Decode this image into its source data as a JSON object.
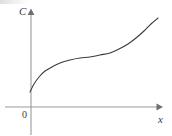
{
  "figure": {
    "kind": "cartesian-sketch",
    "width": 172,
    "height": 135,
    "background_color": "#ffffff",
    "axis_color": "#9b9b9b",
    "curve_color": "#3a3a3a",
    "label_color": "#3c3c3c",
    "y_axis_label": "C",
    "x_axis_label": "x",
    "origin_label": "0"
  },
  "chart_data": {
    "type": "line",
    "title": "",
    "subtitle": "",
    "xlabel": "x",
    "ylabel": "C",
    "grid": false,
    "legend": null,
    "legend_position": "none",
    "annotations": [],
    "axes": {
      "x_axis_pixel_y": 107,
      "y_axis_pixel_x": 31,
      "x_axis_from_pixel_x": 5,
      "x_axis_to_pixel_x": 160,
      "y_axis_from_pixel_y": 12,
      "y_axis_to_pixel_y": 135,
      "x_arrow": true,
      "y_arrow": true,
      "x_tick_labels": [],
      "y_tick_labels": [],
      "xlim": [
        0,
        1
      ],
      "ylim": [
        0,
        1
      ]
    },
    "series": [
      {
        "name": "C(x)",
        "shape": "monotonic-increasing-sigmoid",
        "color": "#3a3a3a",
        "line_width": 1.1,
        "points_pixel": [
          [
            30,
            92
          ],
          [
            34,
            84
          ],
          [
            39,
            77
          ],
          [
            45,
            71
          ],
          [
            52,
            67
          ],
          [
            60,
            63
          ],
          [
            70,
            60
          ],
          [
            80,
            58
          ],
          [
            90,
            57
          ],
          [
            100,
            55
          ],
          [
            110,
            53
          ],
          [
            119,
            49
          ],
          [
            128,
            44
          ],
          [
            136,
            38
          ],
          [
            144,
            31
          ],
          [
            151,
            24
          ],
          [
            158,
            18
          ]
        ],
        "x": [
          0.0,
          0.03,
          0.06,
          0.11,
          0.17,
          0.22,
          0.3,
          0.38,
          0.46,
          0.54,
          0.61,
          0.68,
          0.75,
          0.81,
          0.87,
          0.93,
          0.98
        ],
        "y": [
          0.16,
          0.24,
          0.31,
          0.38,
          0.42,
          0.46,
          0.49,
          0.52,
          0.53,
          0.55,
          0.57,
          0.61,
          0.66,
          0.72,
          0.8,
          0.87,
          0.94
        ]
      }
    ]
  }
}
